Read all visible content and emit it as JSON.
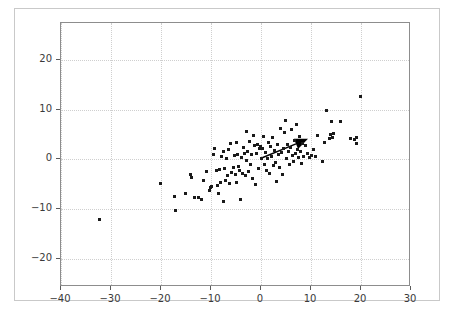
{
  "figure": {
    "background_color": "#ffffff",
    "frame_color": "#c9c9c9",
    "axes_color": "#8d8d8d",
    "grid_color": "#cfcfcf",
    "marker_color": "#1a1a1a",
    "arrow_color": "#000000"
  },
  "chart_data": {
    "type": "scatter",
    "title": "",
    "xlabel": "",
    "ylabel": "",
    "xlim": [
      -40,
      30
    ],
    "ylim": [
      -25.7,
      27.4
    ],
    "xticks": [
      -40,
      -30,
      -20,
      -10,
      0,
      10,
      20,
      30
    ],
    "yticks": [
      -20,
      -10,
      0,
      10,
      20
    ],
    "xtick_labels": [
      "-40",
      "-30",
      "-20",
      "-10",
      "0",
      "10",
      "20",
      "30"
    ],
    "ytick_labels": [
      "-20",
      "-10",
      "0",
      "10",
      "20"
    ],
    "grid": true,
    "legend": null,
    "marker": "square",
    "marker_size": 3,
    "points": [
      [
        -32.4,
        -12.1
      ],
      [
        -20.2,
        -4.8
      ],
      [
        -17.3,
        -7.4
      ],
      [
        -17.1,
        -10.4
      ],
      [
        -15.2,
        -6.9
      ],
      [
        -14.1,
        -3.0
      ],
      [
        -13.9,
        -3.6
      ],
      [
        -13.3,
        -7.7
      ],
      [
        -12.5,
        -7.6
      ],
      [
        -11.9,
        -8.0
      ],
      [
        -11.5,
        -4.2
      ],
      [
        -10.9,
        -2.5
      ],
      [
        -10.4,
        -6.2
      ],
      [
        -10.1,
        -5.6
      ],
      [
        -9.9,
        -5.5
      ],
      [
        -9.5,
        1.0
      ],
      [
        -9.3,
        2.1
      ],
      [
        -8.9,
        -2.3
      ],
      [
        -8.7,
        -5.2
      ],
      [
        -8.5,
        -6.9
      ],
      [
        -8.3,
        -2.1
      ],
      [
        -8.1,
        -4.6
      ],
      [
        -7.9,
        0.5
      ],
      [
        -7.6,
        -8.5
      ],
      [
        -7.5,
        1.6
      ],
      [
        -7.3,
        -1.9
      ],
      [
        -7.1,
        -4.3
      ],
      [
        -6.9,
        0.1
      ],
      [
        -6.7,
        -3.3
      ],
      [
        -6.5,
        1.9
      ],
      [
        -6.3,
        -4.8
      ],
      [
        -6.1,
        3.2
      ],
      [
        -5.9,
        -2.6
      ],
      [
        -5.6,
        -1.6
      ],
      [
        -5.4,
        0.8
      ],
      [
        -5.2,
        -3.0
      ],
      [
        -5.0,
        3.4
      ],
      [
        -4.9,
        -4.7
      ],
      [
        -4.7,
        1.0
      ],
      [
        -4.5,
        -1.4
      ],
      [
        -4.3,
        -2.2
      ],
      [
        -4.1,
        -8.1
      ],
      [
        -4.0,
        0.4
      ],
      [
        -3.8,
        -2.8
      ],
      [
        -3.6,
        2.4
      ],
      [
        -3.4,
        1.2
      ],
      [
        -3.2,
        -3.2
      ],
      [
        -3.0,
        5.5
      ],
      [
        -2.9,
        -0.2
      ],
      [
        -2.7,
        1.5
      ],
      [
        -2.5,
        -2.5
      ],
      [
        -2.3,
        3.6
      ],
      [
        -2.1,
        -1.1
      ],
      [
        -1.9,
        0.9
      ],
      [
        -1.7,
        -3.9
      ],
      [
        -1.5,
        4.8
      ],
      [
        -1.3,
        2.7
      ],
      [
        -1.1,
        -5.1
      ],
      [
        -0.9,
        1.1
      ],
      [
        -0.7,
        3.0
      ],
      [
        -0.5,
        -1.8
      ],
      [
        -0.3,
        2.2
      ],
      [
        -0.2,
        2.5
      ],
      [
        0.1,
        0.2
      ],
      [
        0.3,
        2.2
      ],
      [
        0.5,
        4.6
      ],
      [
        0.7,
        -1.0
      ],
      [
        0.9,
        1.3
      ],
      [
        1.1,
        -2.3
      ],
      [
        1.3,
        0.1
      ],
      [
        1.5,
        3.3
      ],
      [
        1.7,
        -2.9
      ],
      [
        1.9,
        2.6
      ],
      [
        2.1,
        0.5
      ],
      [
        2.3,
        4.3
      ],
      [
        2.5,
        -1.3
      ],
      [
        2.7,
        1.8
      ],
      [
        2.9,
        -0.6
      ],
      [
        3.1,
        -4.4
      ],
      [
        3.3,
        2.9
      ],
      [
        3.5,
        0.9
      ],
      [
        3.7,
        -1.6
      ],
      [
        3.9,
        6.2
      ],
      [
        4.1,
        1.4
      ],
      [
        4.3,
        -3.0
      ],
      [
        4.5,
        2.1
      ],
      [
        4.7,
        5.3
      ],
      [
        4.9,
        7.8
      ],
      [
        5.1,
        0.2
      ],
      [
        5.3,
        3.0
      ],
      [
        5.5,
        1.6
      ],
      [
        5.7,
        -1.1
      ],
      [
        5.9,
        2.4
      ],
      [
        6.1,
        5.9
      ],
      [
        6.3,
        0.7
      ],
      [
        6.5,
        -0.4
      ],
      [
        6.7,
        3.8
      ],
      [
        6.9,
        1.1
      ],
      [
        7.1,
        7.0
      ],
      [
        7.3,
        2.0
      ],
      [
        7.5,
        0.3
      ],
      [
        7.7,
        4.5
      ],
      [
        7.9,
        1.5
      ],
      [
        8.1,
        -0.8
      ],
      [
        8.3,
        3.1
      ],
      [
        8.5,
        0.6
      ],
      [
        8.9,
        2.8
      ],
      [
        9.3,
        1.2
      ],
      [
        9.7,
        0.4
      ],
      [
        10.1,
        0.8
      ],
      [
        10.5,
        1.9
      ],
      [
        10.9,
        0.5
      ],
      [
        11.3,
        4.7
      ],
      [
        12.2,
        -0.5
      ],
      [
        12.7,
        3.4
      ],
      [
        13.1,
        9.9
      ],
      [
        13.6,
        4.2
      ],
      [
        13.9,
        5.0
      ],
      [
        14.0,
        7.6
      ],
      [
        14.2,
        4.4
      ],
      [
        14.4,
        5.1
      ],
      [
        15.8,
        7.6
      ],
      [
        17.9,
        4.2
      ],
      [
        18.6,
        3.9
      ],
      [
        19.0,
        4.4
      ],
      [
        19.1,
        3.2
      ],
      [
        19.8,
        12.6
      ]
    ],
    "annotations": [
      {
        "kind": "arrow",
        "start": [
          0.0,
          0.2
        ],
        "end": [
          9.4,
          4.1
        ],
        "color": "#000000",
        "linewidth": 1.4,
        "head": "filled-triangle"
      }
    ]
  }
}
